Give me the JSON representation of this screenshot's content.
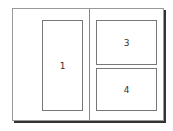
{
  "layout": {
    "frames": [
      {
        "label": "1"
      },
      {
        "label": "3"
      },
      {
        "label": "4"
      }
    ]
  }
}
